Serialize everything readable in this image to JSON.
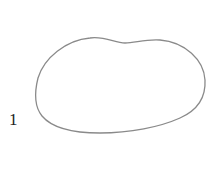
{
  "figure": {
    "shape": {
      "type": "closed-blob-outline",
      "stroke": "#8a8a8a",
      "fill": "none"
    },
    "label": {
      "text": "1",
      "color": "#222222"
    }
  }
}
